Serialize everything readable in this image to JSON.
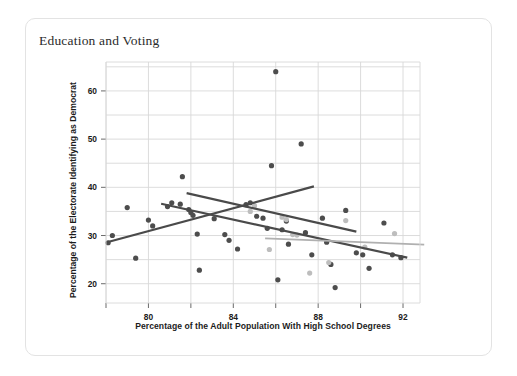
{
  "card": {
    "title": "Education and Voting"
  },
  "chart_data": {
    "type": "scatter",
    "title": "Education and Voting",
    "xlabel": "Percentage of the Adult Population With High School Degrees",
    "ylabel": "Percentage of the Electorate Identifying as Democrat",
    "xlim": [
      78.0,
      92.8
    ],
    "ylim": [
      16.0,
      66.0
    ],
    "xticks": [
      80,
      84,
      88,
      92
    ],
    "xticklabels": [
      "80",
      "84",
      "88",
      "92"
    ],
    "x_minor_ticks": [
      78,
      82,
      86,
      90
    ],
    "yticks": [
      20,
      30,
      40,
      50,
      60
    ],
    "yticklabels": [
      "20",
      "30",
      "40",
      "50",
      "60"
    ],
    "y_minor_ticks": [
      25,
      35,
      45,
      55,
      65
    ],
    "grid": true,
    "grid_color": "#d8d8d8",
    "legend": null,
    "legend_position": "none",
    "marker_size_px": 4.0,
    "series": [
      {
        "name": "dark-points",
        "color": "#4d4d4d",
        "marker": "circle",
        "points": [
          [
            78.1,
            28.5
          ],
          [
            78.3,
            30.0
          ],
          [
            79.0,
            35.8
          ],
          [
            79.4,
            25.3
          ],
          [
            80.0,
            33.2
          ],
          [
            80.2,
            32.0
          ],
          [
            80.9,
            36.0
          ],
          [
            81.1,
            36.8
          ],
          [
            81.5,
            36.5
          ],
          [
            81.6,
            42.2
          ],
          [
            81.9,
            35.4
          ],
          [
            82.0,
            34.8
          ],
          [
            82.1,
            34.2
          ],
          [
            82.3,
            30.3
          ],
          [
            82.4,
            22.8
          ],
          [
            83.1,
            33.5
          ],
          [
            83.6,
            30.2
          ],
          [
            83.8,
            29.0
          ],
          [
            84.2,
            27.2
          ],
          [
            84.6,
            36.4
          ],
          [
            84.8,
            36.8
          ],
          [
            85.1,
            34.0
          ],
          [
            85.4,
            33.6
          ],
          [
            85.6,
            31.5
          ],
          [
            85.8,
            44.5
          ],
          [
            86.0,
            64.0
          ],
          [
            86.1,
            20.8
          ],
          [
            86.3,
            31.2
          ],
          [
            86.5,
            33.0
          ],
          [
            86.6,
            28.2
          ],
          [
            87.2,
            49.0
          ],
          [
            87.4,
            30.6
          ],
          [
            87.7,
            26.0
          ],
          [
            88.2,
            33.6
          ],
          [
            88.4,
            28.6
          ],
          [
            88.6,
            24.0
          ],
          [
            88.8,
            19.2
          ],
          [
            89.3,
            35.2
          ],
          [
            89.8,
            26.4
          ],
          [
            90.1,
            26.0
          ],
          [
            90.4,
            23.2
          ],
          [
            91.1,
            32.6
          ],
          [
            91.5,
            26.0
          ],
          [
            91.9,
            25.4
          ]
        ]
      },
      {
        "name": "light-points",
        "color": "#bdbdbd",
        "marker": "circle",
        "points": [
          [
            84.8,
            35.0
          ],
          [
            85.0,
            36.2
          ],
          [
            85.7,
            27.1
          ],
          [
            86.3,
            33.8
          ],
          [
            86.5,
            33.3
          ],
          [
            86.8,
            30.2
          ],
          [
            87.0,
            30.1
          ],
          [
            87.6,
            22.2
          ],
          [
            88.5,
            24.4
          ],
          [
            89.3,
            33.1
          ],
          [
            90.2,
            27.6
          ],
          [
            91.6,
            30.4
          ]
        ]
      }
    ],
    "trend_lines": [
      {
        "name": "rising-trend-line",
        "color": "#4a4a4a",
        "width_px": 2.2,
        "x_start": 78.05,
        "y_start": 28.6,
        "x_end": 87.8,
        "y_end": 40.2
      },
      {
        "name": "falling-trend-line-upper",
        "color": "#4a4a4a",
        "width_px": 2.2,
        "x_start": 81.8,
        "y_start": 38.8,
        "x_end": 89.8,
        "y_end": 30.8
      },
      {
        "name": "falling-trend-line-lower",
        "color": "#4a4a4a",
        "width_px": 2.2,
        "x_start": 80.6,
        "y_start": 36.6,
        "x_end": 92.2,
        "y_end": 25.4
      },
      {
        "name": "flat-trend-line",
        "color": "#b0b0b0",
        "width_px": 1.8,
        "x_start": 85.5,
        "y_start": 29.4,
        "x_end": 93.0,
        "y_end": 28.1
      }
    ]
  }
}
